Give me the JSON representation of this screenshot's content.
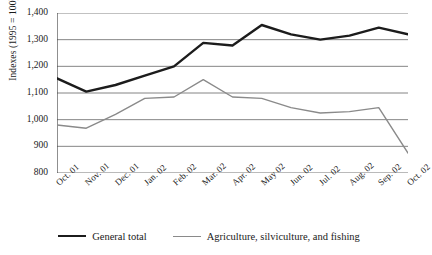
{
  "chart_data": {
    "type": "line",
    "title": "",
    "xlabel": "",
    "ylabel": "Indexes (1995 = 100)",
    "ylim": [
      800,
      1400
    ],
    "ytick_step": 100,
    "grid": true,
    "legend_position": "bottom",
    "categories": [
      "Oct. 01",
      "Nov. 01",
      "Dec. 01",
      "Jan. 02",
      "Feb. 02",
      "Mar. 02",
      "Apr. 02",
      "May 02",
      "Jun. 02",
      "Jul. 02",
      "Aug. 02",
      "Sep. 02",
      "Oct. 02"
    ],
    "ytick_labels": [
      "1,400",
      "1,300",
      "1,200",
      "1,100",
      "1,000",
      "900",
      "800"
    ],
    "ytick_values": [
      1400,
      1300,
      1200,
      1100,
      1000,
      900,
      800
    ],
    "series": [
      {
        "name": "General total",
        "color": "#1c1c1c",
        "width": 2.4,
        "values": [
          1155,
          1105,
          1130,
          1165,
          1200,
          1288,
          1278,
          1355,
          1320,
          1300,
          1315,
          1345,
          1320
        ]
      },
      {
        "name": "Agriculture, silviculture, and fishing",
        "color": "#8a8a8a",
        "width": 1.4,
        "values": [
          980,
          968,
          1020,
          1080,
          1085,
          1150,
          1085,
          1080,
          1045,
          1025,
          1030,
          1045,
          875
        ]
      }
    ]
  },
  "axis": {
    "y_label": "Indexes (1995 = 100)"
  },
  "legend": {
    "items": [
      {
        "label": "General total",
        "style": "total"
      },
      {
        "label": "Agriculture, silviculture, and fishing",
        "style": "agri"
      }
    ]
  },
  "source": {
    "text": ""
  }
}
